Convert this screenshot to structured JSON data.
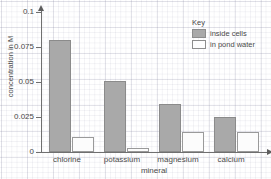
{
  "chart_data": {
    "type": "bar",
    "title": "",
    "xlabel": "mineral",
    "ylabel": "concentration in M",
    "categories": [
      "chlorine",
      "potassium",
      "magnesium",
      "calcium"
    ],
    "series": [
      {
        "name": "inside cells",
        "values": [
          0.08,
          0.051,
          0.034,
          0.025
        ]
      },
      {
        "name": "in pond water",
        "values": [
          0.011,
          0.003,
          0.014,
          0.014
        ]
      }
    ],
    "ylim": [
      0,
      0.1
    ],
    "ytick_labels": [
      "0.1",
      "0.075",
      "0.05",
      "0.025",
      "0"
    ],
    "ytick_values": [
      0.1,
      0.075,
      0.05,
      0.025,
      0
    ],
    "grid": true,
    "grid_style": "graph-paper",
    "legend_position": "top-right",
    "legend_title": "Key",
    "colors": {
      "inside_cells": "#a9a9a9",
      "in_pond_water": "#fcfcfc",
      "bar_outline": "#8d8d8d",
      "axis": "#6f6f6f",
      "text": "#4a4a4a",
      "background": "#ffffff"
    }
  },
  "axes": {
    "y_title": "concentration in M",
    "x_title": "mineral",
    "ticks": [
      {
        "label": "0.1",
        "value": 0.1
      },
      {
        "label": "0.075",
        "value": 0.075
      },
      {
        "label": "0.05",
        "value": 0.05
      },
      {
        "label": "0.025",
        "value": 0.025
      },
      {
        "label": "0",
        "value": 0
      }
    ]
  },
  "legend": {
    "title": "Key",
    "entries": [
      {
        "label": "inside cells",
        "swatch": "filled-gray-swatch"
      },
      {
        "label": "in pond water",
        "swatch": "hollow-white-swatch"
      }
    ]
  },
  "categories": [
    {
      "label": "chlorine"
    },
    {
      "label": "potassium"
    },
    {
      "label": "magnesium"
    },
    {
      "label": "calcium"
    }
  ]
}
